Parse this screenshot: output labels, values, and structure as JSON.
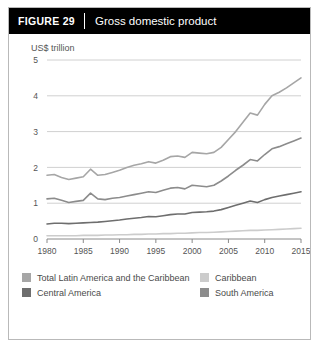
{
  "figure": {
    "label": "FIGURE  29",
    "title": "Gross domestic product"
  },
  "colors": {
    "total": "#a6a6a6",
    "south_america": "#8c8c8c",
    "central_america": "#6e6e6e",
    "caribbean": "#cccccc",
    "gridline": "#d0d0d0",
    "axis": "#8a8a8a",
    "text": "#555555",
    "header_bg": "#000000",
    "border": "#b9b9b9"
  },
  "legend": {
    "items": [
      {
        "label": "Total Latin America and the Caribbean",
        "color": "#a6a6a6",
        "key": "total"
      },
      {
        "label": "Caribbean",
        "color": "#cccccc",
        "key": "caribbean"
      },
      {
        "label": "Central America",
        "color": "#6e6e6e",
        "key": "central_america"
      },
      {
        "label": "South America",
        "color": "#8c8c8c",
        "key": "south_america"
      }
    ]
  },
  "chart_data": {
    "type": "line",
    "title": "Gross domestic product",
    "xlabel": "",
    "ylabel": "US$ trillion",
    "ylim": [
      0,
      5
    ],
    "xlim": [
      1980,
      2015
    ],
    "yticks": [
      0,
      1,
      2,
      3,
      4,
      5
    ],
    "xticks": [
      1980,
      1985,
      1990,
      1995,
      2000,
      2005,
      2010,
      2015
    ],
    "grid": true,
    "legend_position": "bottom",
    "x": [
      1980,
      1981,
      1982,
      1983,
      1984,
      1985,
      1986,
      1987,
      1988,
      1989,
      1990,
      1991,
      1992,
      1993,
      1994,
      1995,
      1996,
      1997,
      1998,
      1999,
      2000,
      2001,
      2002,
      2003,
      2004,
      2005,
      2006,
      2007,
      2008,
      2009,
      2010,
      2011,
      2012,
      2013,
      2014,
      2015
    ],
    "series": [
      {
        "name": "Total Latin America and the Caribbean",
        "color": "#a6a6a6",
        "values": [
          1.78,
          1.8,
          1.72,
          1.66,
          1.7,
          1.74,
          1.95,
          1.78,
          1.8,
          1.86,
          1.92,
          2.0,
          2.06,
          2.1,
          2.16,
          2.12,
          2.2,
          2.3,
          2.32,
          2.28,
          2.42,
          2.4,
          2.38,
          2.42,
          2.56,
          2.78,
          3.0,
          3.26,
          3.52,
          3.46,
          3.76,
          4.0,
          4.1,
          4.22,
          4.36,
          4.5
        ]
      },
      {
        "name": "South America",
        "color": "#8c8c8c",
        "values": [
          1.12,
          1.14,
          1.08,
          1.02,
          1.05,
          1.08,
          1.28,
          1.12,
          1.1,
          1.14,
          1.16,
          1.2,
          1.24,
          1.28,
          1.32,
          1.3,
          1.36,
          1.42,
          1.44,
          1.4,
          1.5,
          1.48,
          1.46,
          1.5,
          1.62,
          1.76,
          1.92,
          2.06,
          2.22,
          2.18,
          2.36,
          2.52,
          2.58,
          2.66,
          2.74,
          2.82
        ]
      },
      {
        "name": "Central America",
        "color": "#6e6e6e",
        "values": [
          0.42,
          0.44,
          0.44,
          0.43,
          0.44,
          0.45,
          0.46,
          0.47,
          0.49,
          0.51,
          0.53,
          0.56,
          0.58,
          0.6,
          0.63,
          0.62,
          0.65,
          0.68,
          0.7,
          0.7,
          0.74,
          0.75,
          0.76,
          0.78,
          0.82,
          0.88,
          0.94,
          1.0,
          1.06,
          1.02,
          1.1,
          1.16,
          1.2,
          1.24,
          1.28,
          1.32
        ]
      },
      {
        "name": "Caribbean",
        "color": "#cccccc",
        "values": [
          0.09,
          0.09,
          0.09,
          0.09,
          0.09,
          0.1,
          0.1,
          0.1,
          0.11,
          0.11,
          0.12,
          0.12,
          0.13,
          0.13,
          0.14,
          0.14,
          0.15,
          0.15,
          0.16,
          0.16,
          0.17,
          0.18,
          0.18,
          0.19,
          0.2,
          0.21,
          0.22,
          0.23,
          0.24,
          0.24,
          0.25,
          0.26,
          0.27,
          0.28,
          0.29,
          0.3
        ]
      }
    ]
  }
}
